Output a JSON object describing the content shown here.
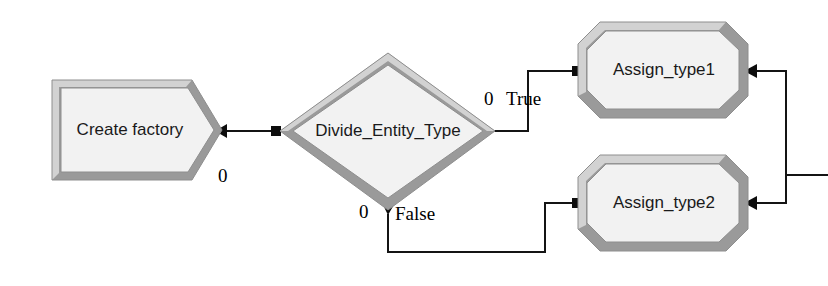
{
  "diagram": {
    "background_color": "#ffffff",
    "nodes": [
      {
        "id": "create-factory",
        "label": "Create factory",
        "shape": "pentagon-arrow",
        "x": 52,
        "y": 80,
        "width": 170,
        "height": 100,
        "fill_color": "#f2f2f2",
        "border_color": "#9a9a9a"
      },
      {
        "id": "divide-entity-type",
        "label": "Divide_Entity_Type",
        "shape": "diamond",
        "x": 280,
        "y": 53,
        "width": 215,
        "height": 157,
        "fill_color": "#f2f2f2",
        "border_color": "#9a9a9a"
      },
      {
        "id": "assign-type1",
        "label": "Assign_type1",
        "shape": "octagon",
        "x": 578,
        "y": 22,
        "width": 170,
        "height": 96,
        "fill_color": "#f2f2f2",
        "border_color": "#9a9a9a"
      },
      {
        "id": "assign-type2",
        "label": "Assign_type2",
        "shape": "octagon",
        "x": 578,
        "y": 155,
        "width": 170,
        "height": 96,
        "fill_color": "#f2f2f2",
        "border_color": "#9a9a9a"
      }
    ],
    "port_labels": [
      {
        "id": "create-factory-out-index",
        "text": "0",
        "x": 218,
        "y": 178
      },
      {
        "id": "divide-true-index",
        "text": "0",
        "x": 484,
        "y": 101
      },
      {
        "id": "divide-true-name",
        "text": "True",
        "x": 506,
        "y": 101
      },
      {
        "id": "divide-false-index",
        "text": "0",
        "x": 359,
        "y": 214
      },
      {
        "id": "divide-false-name",
        "text": "False",
        "x": 395,
        "y": 216
      }
    ],
    "edges": [
      {
        "id": "edge-create-to-divide",
        "from": "create-factory",
        "to": "divide-entity-type",
        "points": "227,131 272,131",
        "source_marker": "arrowhead-left",
        "target_marker": "square"
      },
      {
        "id": "edge-divide-true-to-assign1",
        "from": "divide-entity-type",
        "to": "assign-type1",
        "label": "True",
        "points": "491,131 528,131 528,71 573,71",
        "source_marker": "arrowhead-right",
        "target_marker": "square"
      },
      {
        "id": "edge-divide-false-to-assign2",
        "from": "divide-entity-type",
        "to": "assign-type2",
        "label": "False",
        "points": "388,214 388,252 545,252 545,203 573,203",
        "source_marker": "arrowhead-down",
        "target_marker": "square"
      },
      {
        "id": "edge-assign1-out",
        "from": "assign-type1",
        "points": "752,71 786,71 786,175",
        "source_marker": "arrowhead-left",
        "target_marker": "none"
      },
      {
        "id": "edge-assign2-out",
        "from": "assign-type2",
        "points": "752,203 786,203 786,175",
        "source_marker": "arrowhead-left",
        "target_marker": "none"
      },
      {
        "id": "edge-merged-exit",
        "points": "786,175 828,175",
        "source_marker": "none",
        "target_marker": "none"
      }
    ]
  }
}
